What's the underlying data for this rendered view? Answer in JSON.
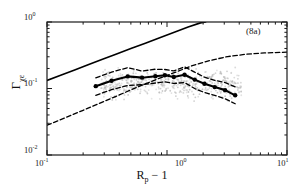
{
  "axes": {
    "x_title_main": "R",
    "x_title_sub": "p",
    "x_title_tail": " − 1",
    "y_title_main": "Γ",
    "y_title_sub": "χε",
    "x_ticks": [
      {
        "mantissa": "10",
        "exponent": "-1",
        "value": 0.1
      },
      {
        "mantissa": "10",
        "exponent": "0",
        "value": 1
      },
      {
        "mantissa": "10",
        "exponent": "1",
        "value": 10
      }
    ],
    "y_ticks": [
      {
        "mantissa": "10",
        "exponent": "0",
        "value": 1
      },
      {
        "mantissa": "10",
        "exponent": "-1",
        "value": 0.1
      },
      {
        "mantissa": "10",
        "exponent": "-2",
        "value": 0.01
      }
    ],
    "xlim": [
      0.1,
      10
    ],
    "ylim": [
      0.01,
      1
    ],
    "xscale": "log",
    "yscale": "log",
    "grid": false
  },
  "annotation": {
    "panel_label": "(8a)"
  },
  "colors": {
    "axis": "#1a1a1a",
    "solid_curve": "#000000",
    "dashed_curve": "#000000",
    "marker_line": "#000000",
    "scatter": "#b9b9b9"
  },
  "chart_data": {
    "type": "line",
    "title": "",
    "xlabel": "R_p - 1",
    "ylabel": "Gamma_chi-epsilon",
    "xscale": "log",
    "yscale": "log",
    "xlim": [
      0.1,
      10
    ],
    "ylim": [
      0.01,
      1
    ],
    "grid": false,
    "legend": "none",
    "annotations": [
      {
        "text": "(8a)",
        "x": 6.4,
        "y": 0.72
      }
    ],
    "series": [
      {
        "name": "upper-solid-theory",
        "style": "solid",
        "width": 1.6,
        "x": [
          0.1,
          0.13,
          0.17,
          0.22,
          0.29,
          0.38,
          0.5,
          0.66,
          0.87,
          1.15,
          1.5,
          1.9,
          2.1
        ],
        "y": [
          0.132,
          0.158,
          0.19,
          0.228,
          0.275,
          0.33,
          0.398,
          0.48,
          0.58,
          0.7,
          0.84,
          0.97,
          1.0
        ]
      },
      {
        "name": "lower-dashed-theory",
        "style": "dashed",
        "width": 1.3,
        "x": [
          0.1,
          0.14,
          0.2,
          0.28,
          0.4,
          0.56,
          0.8,
          1.15,
          1.6,
          2.3,
          3.2,
          4.6,
          6.5,
          10.0
        ],
        "y": [
          0.028,
          0.036,
          0.047,
          0.061,
          0.08,
          0.104,
          0.135,
          0.173,
          0.218,
          0.265,
          0.302,
          0.328,
          0.343,
          0.352
        ]
      },
      {
        "name": "data-mean-markers",
        "style": "solid-markers",
        "width": 2.1,
        "marker": "filled-circle",
        "x": [
          0.255,
          0.345,
          0.47,
          0.62,
          0.8,
          0.96,
          1.14,
          1.4,
          1.7,
          2.05,
          2.5,
          3.05,
          3.7
        ],
        "y": [
          0.1085,
          0.131,
          0.152,
          0.1455,
          0.153,
          0.158,
          0.149,
          0.161,
          0.136,
          0.118,
          0.105,
          0.0945,
          0.079
        ]
      },
      {
        "name": "upper-envelope-dashed",
        "style": "dashed",
        "width": 1.3,
        "x": [
          0.255,
          0.345,
          0.47,
          0.62,
          0.8,
          0.96,
          1.14,
          1.4,
          1.7,
          2.05,
          2.5,
          3.05,
          3.7
        ],
        "y": [
          0.145,
          0.176,
          0.206,
          0.183,
          0.195,
          0.193,
          0.184,
          0.212,
          0.176,
          0.148,
          0.133,
          0.123,
          0.106
        ]
      },
      {
        "name": "lower-envelope-dashed",
        "style": "dashed",
        "width": 1.3,
        "x": [
          0.255,
          0.345,
          0.47,
          0.62,
          0.8,
          0.96,
          1.14,
          1.4,
          1.7,
          2.05,
          2.5,
          3.05,
          3.7
        ],
        "y": [
          0.079,
          0.096,
          0.111,
          0.114,
          0.121,
          0.126,
          0.119,
          0.123,
          0.1,
          0.087,
          0.079,
          0.07,
          0.059
        ]
      }
    ],
    "scatter": {
      "name": "background-point-cloud",
      "marker": "dot",
      "color": "#b9b9b9",
      "size": 0.9,
      "count": 520,
      "x_range": [
        0.28,
        4.2
      ],
      "y_range": [
        0.012,
        0.62
      ],
      "description": "faint grey scattered individual measurements concentrated between 0.3 and 4 on x"
    }
  }
}
